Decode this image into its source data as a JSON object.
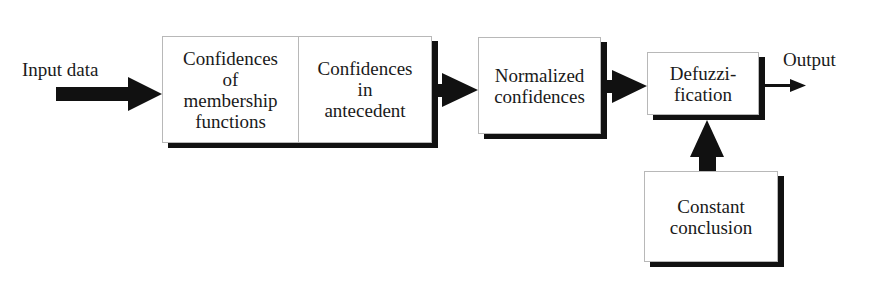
{
  "diagram": {
    "type": "block-flow",
    "input_label": "Input data",
    "output_label": "Output",
    "blocks": [
      {
        "id": "membership",
        "lines": [
          "Confidences",
          "of",
          "membership",
          "functions"
        ]
      },
      {
        "id": "antecedent",
        "lines": [
          "Confidences",
          "in",
          "antecedent"
        ]
      },
      {
        "id": "normalized",
        "lines": [
          "Normalized",
          "confidences"
        ]
      },
      {
        "id": "defuzzification",
        "lines": [
          "Defuzzi-",
          "fication"
        ]
      },
      {
        "id": "constant",
        "lines": [
          "Constant",
          "conclusion"
        ]
      }
    ],
    "edges": [
      {
        "from": "Input data",
        "to": "membership"
      },
      {
        "from": "antecedent",
        "to": "normalized"
      },
      {
        "from": "normalized",
        "to": "defuzzification"
      },
      {
        "from": "constant",
        "to": "defuzzification"
      },
      {
        "from": "defuzzification",
        "to": "Output"
      }
    ],
    "colors": {
      "arrow": "#111111",
      "box_border": "#b8b8b8",
      "shadow": "#111111",
      "text": "#1a1a1a"
    }
  }
}
